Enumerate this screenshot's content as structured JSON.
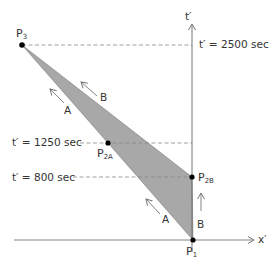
{
  "diagram": {
    "axes": {
      "vertical_label": "t′",
      "horizontal_label": "x′"
    },
    "time_lines": [
      {
        "label": "t′ = 2500 sec",
        "value": 2500
      },
      {
        "label": "t′ = 1250 sec",
        "value": 1250
      },
      {
        "label": "t′ = 800 sec",
        "value": 800
      }
    ],
    "points": {
      "p3": {
        "main": "P",
        "sub": "3"
      },
      "p2a": {
        "main": "P",
        "sub": "2A"
      },
      "p2b": {
        "main": "P",
        "sub": "2B"
      },
      "p1": {
        "main": "P",
        "sub": "1"
      }
    },
    "path_labels": {
      "a_upper": "A",
      "b_upper": "B",
      "a_lower": "A",
      "b_lower": "B"
    },
    "colors": {
      "shade": "#a8a8a8",
      "line": "#555555",
      "dash": "#888888",
      "point": "#000000"
    }
  }
}
